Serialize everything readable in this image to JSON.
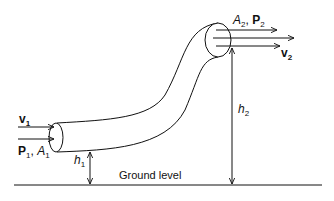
{
  "diagram": {
    "type": "bernoulli-pipe-flow",
    "inlet": {
      "velocity_label": "v",
      "velocity_sub": "1",
      "pressure_label": "P",
      "pressure_sub": "1",
      "area_label": "A",
      "area_sub": "1",
      "separator": ", "
    },
    "outlet": {
      "area_label": "A",
      "area_sub": "2",
      "pressure_label": "P",
      "pressure_sub": "2",
      "velocity_label": "v",
      "velocity_sub": "2",
      "separator": ", "
    },
    "heights": {
      "h1_label": "h",
      "h1_sub": "1",
      "h2_label": "h",
      "h2_sub": "2"
    },
    "ground_label": "Ground level",
    "colors": {
      "stroke": "#111111",
      "background": "#ffffff"
    }
  }
}
